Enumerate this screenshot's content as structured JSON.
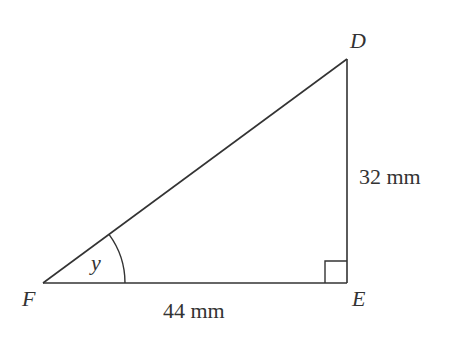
{
  "diagram": {
    "type": "right-triangle",
    "vertices": {
      "D": {
        "label": "D",
        "x": 347,
        "y": 59
      },
      "E": {
        "label": "E",
        "x": 347,
        "y": 283
      },
      "F": {
        "label": "F",
        "x": 43,
        "y": 283
      }
    },
    "sides": {
      "DE": {
        "label": "32 mm",
        "length": 32,
        "unit": "mm"
      },
      "FE": {
        "label": "44 mm",
        "length": 44,
        "unit": "mm"
      }
    },
    "angle": {
      "label": "y",
      "at": "F"
    },
    "right_angle_at": "E",
    "colors": {
      "stroke": "#333333",
      "background": "#ffffff"
    }
  }
}
